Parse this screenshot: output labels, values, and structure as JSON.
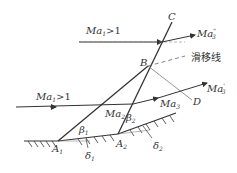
{
  "diagram": {
    "type": "oblique shock reflection / intersection",
    "labels": {
      "C": "C",
      "B": "B",
      "D": "D",
      "A1": "A",
      "A1_sub": "1",
      "A2": "A",
      "A2_sub": "2",
      "ma1_top": "Ma",
      "ma1_top_sub": "1",
      "ma1_top_cond": ">1",
      "ma1_bottom": "Ma",
      "ma1_bottom_sub": "1",
      "ma1_bottom_cond": ">1",
      "ma2": "Ma",
      "ma2_sub": "2",
      "ma3": "Ma",
      "ma3_sub": "3",
      "ma3_prime": "Ma",
      "ma3_prime_sup": "'",
      "ma3_prime_sub": "3",
      "ma3_dprime": "Ma",
      "ma3_dprime_sup": "\"",
      "ma3_dprime_sub": "3",
      "slip_line": "滑移线",
      "beta1": "β",
      "beta1_sub": "1",
      "beta2": "β",
      "beta2_sub": "2",
      "delta1": "δ",
      "delta1_sub": "1",
      "delta2": "δ",
      "delta2_sub": "2"
    },
    "colors": {
      "line": "#333333",
      "thin_line": "#888888"
    }
  }
}
